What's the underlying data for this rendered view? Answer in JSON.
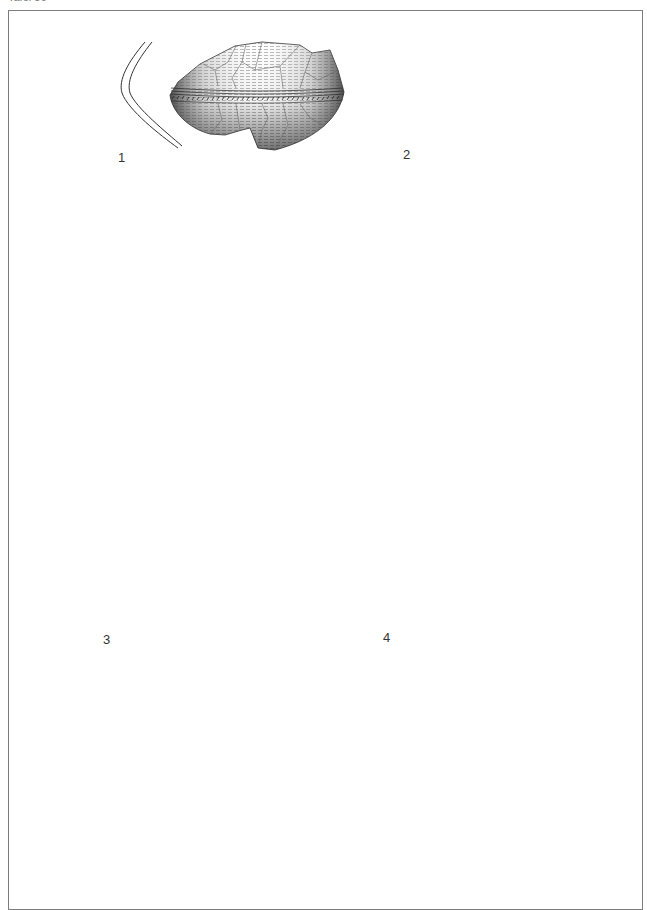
{
  "plate": {
    "header": "Tafel 56",
    "frame_color": "#7d7d7d",
    "ink_color": "#2a2a2a"
  },
  "figures": [
    {
      "number": "1",
      "object": "pottery-sherd",
      "section": "profile-section"
    },
    {
      "number": "2",
      "object": "ring",
      "section": "rhombic-cross-section"
    },
    {
      "number": "3",
      "object": "pin-with-biconical-ribbed-head",
      "section": "round-cross-section"
    },
    {
      "number": "4",
      "object": "pin-with-mushroom-head",
      "section": "round-cross-section"
    }
  ]
}
